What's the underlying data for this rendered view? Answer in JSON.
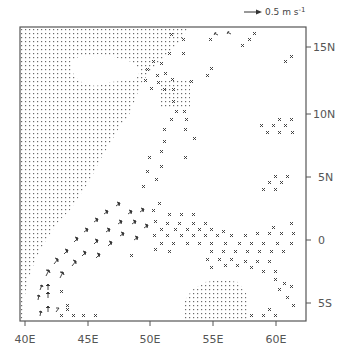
{
  "legend": {
    "reference_vector_label": "0.5 m s-1",
    "reference_vector_text": "0.5 m s",
    "reference_vector_exponent": "-1"
  },
  "axes": {
    "x_ticks": [
      "40E",
      "45E",
      "50E",
      "55E",
      "60E"
    ],
    "y_ticks": [
      "15N",
      "10N",
      "5N",
      "0",
      "5S"
    ]
  },
  "map": {
    "description": "Wind/current vector field over western Indian Ocean; stippled = land (East Africa / Arabia) and missing-data patch",
    "lon_range": [
      40,
      62
    ],
    "lat_range": [
      -7,
      17
    ],
    "colors": {
      "frame": "#555555",
      "stipple": "#6a6a6a",
      "vector": "#333333",
      "background": "#ffffff"
    }
  }
}
